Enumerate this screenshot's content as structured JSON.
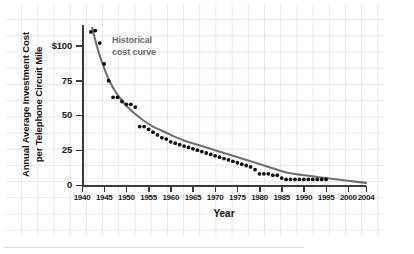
{
  "chart_data": {
    "type": "scatter",
    "title": "",
    "xlabel": "Year",
    "ylabel": "Annual Average Investment Cost per Telephone Circuit Mile",
    "ylabel_line1": "Annual Average Investment Cost",
    "ylabel_line2": "per Telephone Circuit Mile",
    "xlim": [
      1940,
      2004
    ],
    "ylim": [
      0,
      115
    ],
    "grid": true,
    "legend": "none",
    "y_ticks": [
      0,
      25,
      50,
      75,
      100
    ],
    "y_tick_labels": [
      "0",
      "25",
      "50",
      "75",
      "$100"
    ],
    "x_ticks": [
      1940,
      1945,
      1950,
      1955,
      1960,
      1965,
      1970,
      1975,
      1980,
      1985,
      1990,
      1995,
      2000,
      2004
    ],
    "x_tick_labels": [
      "1940",
      "1945",
      "1950",
      "1955",
      "1960",
      "1965",
      "1970",
      "1975",
      "1980",
      "1985",
      "1990",
      "1995",
      "2000",
      "2004"
    ],
    "annotations": [
      {
        "text_line1": "Historical",
        "text_line2": "cost curve",
        "x": 1948,
        "y": 96,
        "color": "#6b6b6b"
      }
    ],
    "series": [
      {
        "name": "Annual average investment cost per telephone circuit mile",
        "marker": "filled-circle",
        "color": "#111111",
        "x": [
          1942,
          1943,
          1944,
          1945,
          1946,
          1947,
          1948,
          1949,
          1950,
          1951,
          1952,
          1953,
          1954,
          1955,
          1956,
          1957,
          1958,
          1959,
          1960,
          1961,
          1962,
          1963,
          1964,
          1965,
          1966,
          1967,
          1968,
          1969,
          1970,
          1971,
          1972,
          1973,
          1974,
          1975,
          1976,
          1977,
          1978,
          1979,
          1980,
          1981,
          1982,
          1983,
          1984,
          1985,
          1986,
          1987,
          1988,
          1989,
          1990,
          1991,
          1992,
          1993,
          1994,
          1995
        ],
        "y": [
          110,
          111,
          102,
          87,
          75,
          63,
          63,
          60,
          58,
          58,
          56,
          42,
          42,
          40,
          38,
          36,
          34,
          33,
          31,
          30,
          29,
          28,
          27,
          26,
          25,
          24,
          23,
          22,
          21,
          20,
          19,
          18,
          17,
          16,
          15,
          14,
          13,
          11,
          8,
          8,
          8,
          7,
          7,
          5,
          4,
          4,
          4,
          4,
          4,
          4,
          4,
          4,
          4,
          4
        ]
      }
    ],
    "fitted_curve": {
      "name": "Historical cost curve",
      "color": "#6f6f6f",
      "x": [
        1942.3,
        1943,
        1944,
        1945,
        1946,
        1947,
        1948,
        1950,
        1952,
        1954,
        1956,
        1958,
        1960,
        1963,
        1966,
        1970,
        1974,
        1978,
        1982,
        1986,
        1990,
        1995,
        2000,
        2004
      ],
      "y": [
        113,
        104,
        93,
        84,
        76,
        70,
        65,
        57,
        51,
        46,
        42,
        39,
        36,
        32,
        29,
        25,
        21,
        17,
        13,
        9,
        7,
        5,
        3,
        1.5
      ]
    },
    "projection_note": "curve extends past last data point (1995) to 2004"
  },
  "source": {
    "text": "SOURCE: AT&T. Recent figures are authors' estimates."
  },
  "colors": {
    "marker": "#111111",
    "curve": "#6f6f6f",
    "axis": "#3a3a3a",
    "grid": "#e3e7ee",
    "annotation": "#6b6b6b",
    "text": "#111111"
  }
}
